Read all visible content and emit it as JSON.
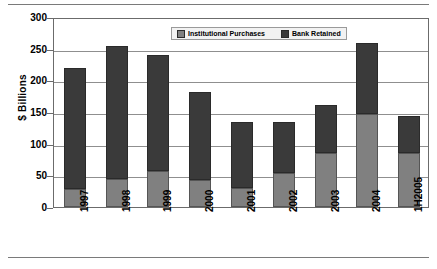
{
  "chart_data": {
    "type": "bar",
    "stacked": true,
    "title": "",
    "subtitle": "",
    "xlabel": "",
    "ylabel": "$ Billions",
    "categories": [
      "1997",
      "1998",
      "1999",
      "2000",
      "2001",
      "2002",
      "2003",
      "2004",
      "1H2005"
    ],
    "series": [
      {
        "name": "Institutional Purchases",
        "color": "#808080",
        "values": [
          28,
          45,
          57,
          43,
          30,
          54,
          86,
          147,
          85
        ]
      },
      {
        "name": "Bank Retained",
        "color": "#3a3a3a",
        "values": [
          192,
          209,
          183,
          139,
          105,
          81,
          75,
          112,
          58
        ]
      }
    ],
    "totals": [
      220,
      254,
      240,
      182,
      135,
      135,
      161,
      259,
      143
    ],
    "ylim": [
      0,
      300
    ],
    "yticks": [
      0,
      50,
      100,
      150,
      200,
      250,
      300
    ],
    "ytick_labels": [
      "0",
      "50",
      "100",
      "150",
      "200",
      "250",
      "300"
    ],
    "grid": true,
    "legend_position": "top-center"
  },
  "axis": {
    "y_title": "$ Billions",
    "y_ticks": [
      "300",
      "250",
      "200",
      "150",
      "100",
      "50",
      "0"
    ],
    "x_ticks": [
      "1997",
      "1998",
      "1999",
      "2000",
      "2001",
      "2002",
      "2003",
      "2004",
      "1H2005"
    ]
  },
  "legend": {
    "items": [
      {
        "label": "Institutional Purchases",
        "color": "#808080"
      },
      {
        "label": "Bank Retained",
        "color": "#3a3a3a"
      }
    ]
  }
}
